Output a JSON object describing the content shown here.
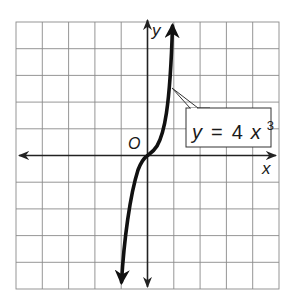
{
  "figure": {
    "type": "function-graph",
    "equation_label": {
      "lhs": "y",
      "equals": "=",
      "coef": "4",
      "var": "x",
      "exponent": "3"
    },
    "axis_labels": {
      "x": "x",
      "y": "y",
      "origin": "O"
    },
    "grid": {
      "columns": 10,
      "rows": 10,
      "unit": 1
    },
    "curve": {
      "function": "y = 4x^3",
      "arrows": "both-ends"
    },
    "colors": {
      "grid": "#8a8a8a",
      "axis": "#222222",
      "curve": "#111111",
      "background": "#ffffff"
    }
  }
}
